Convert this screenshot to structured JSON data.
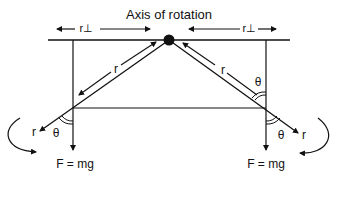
{
  "diagram": {
    "title": "Axis of rotation",
    "r_perp_left": "r⊥",
    "r_perp_right": "r⊥",
    "r_left": "r",
    "r_right": "r",
    "theta_upper_right": "θ",
    "theta_lower_left": "θ",
    "theta_lower_right": "θ",
    "r_vector_left": "r",
    "r_vector_right": "r",
    "force_left": "F = mg",
    "force_right": "F = mg",
    "colors": {
      "line": "#111111",
      "background": "#ffffff"
    }
  }
}
